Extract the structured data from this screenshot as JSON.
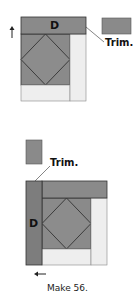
{
  "diagram": {
    "colors": {
      "dark": "#8a8a8a",
      "light": "#eeeeee",
      "stroke": "#333333",
      "background": "#ffffff"
    },
    "step1": {
      "strip_label": "D",
      "trim_label": "Trim.",
      "arrow": "up-arrow"
    },
    "step2": {
      "strip_label": "D",
      "trim_label": "Trim.",
      "arrow": "left-arrow"
    },
    "caption": "Make 56."
  }
}
